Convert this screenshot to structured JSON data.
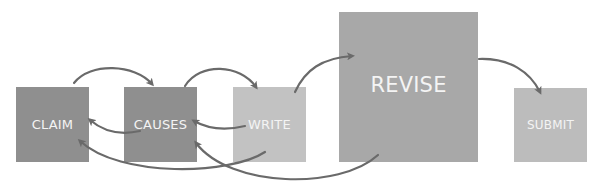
{
  "diagram": {
    "nodes": [
      {
        "id": "claim",
        "label": "CLAIM",
        "color": "#8f8f8f"
      },
      {
        "id": "causes",
        "label": "CAUSES",
        "color": "#8f8f8f"
      },
      {
        "id": "write",
        "label": "WRITE",
        "color": "#c2c2c2"
      },
      {
        "id": "revise",
        "label": "REVISE",
        "color": "#a8a8a8"
      },
      {
        "id": "submit",
        "label": "SUBMIT",
        "color": "#bcbcbc"
      }
    ],
    "edges": [
      {
        "from": "claim",
        "to": "causes",
        "style": "forward-arc-top"
      },
      {
        "from": "causes",
        "to": "write",
        "style": "forward-arc-top"
      },
      {
        "from": "write",
        "to": "revise",
        "style": "forward-arc-top"
      },
      {
        "from": "revise",
        "to": "submit",
        "style": "forward-arc-top"
      },
      {
        "from": "causes",
        "to": "claim",
        "style": "back-arc-middle"
      },
      {
        "from": "write",
        "to": "causes",
        "style": "back-arc-middle"
      },
      {
        "from": "write",
        "to": "claim",
        "style": "back-arc-bottom"
      },
      {
        "from": "revise",
        "to": "causes",
        "style": "back-arc-bottom"
      }
    ],
    "arrow_color": "#6a6a6a"
  }
}
